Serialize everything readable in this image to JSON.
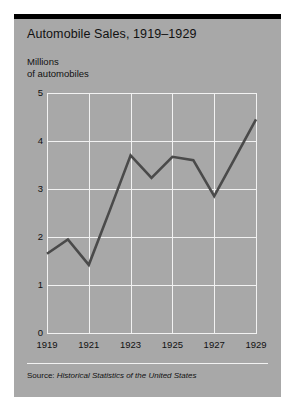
{
  "figure": {
    "title": "Automobile Sales, 1919–1929",
    "caption_line1": "Millions",
    "caption_line2": "of automobiles",
    "source_label": "Source:",
    "source_title": "Historical Statistics of the United States",
    "background_color": "#a8a8a8",
    "rule_color": "#000000",
    "grid_color": "#f2f2f2",
    "line_color": "#4a4a4a",
    "text_color": "#111111"
  },
  "chart_data": {
    "type": "line",
    "title": "Automobile Sales, 1919–1929",
    "subtitle": "",
    "xlabel": "",
    "ylabel": "Millions of automobiles",
    "x": [
      1919,
      1920,
      1921,
      1922,
      1923,
      1924,
      1925,
      1926,
      1927,
      1928,
      1929
    ],
    "values": [
      1.65,
      1.95,
      1.42,
      2.55,
      3.7,
      3.23,
      3.67,
      3.6,
      2.85,
      3.65,
      4.45
    ],
    "series": [
      {
        "name": "Automobile sales",
        "values": [
          1.65,
          1.95,
          1.42,
          2.55,
          3.7,
          3.23,
          3.67,
          3.6,
          2.85,
          3.65,
          4.45
        ]
      }
    ],
    "xlim": [
      1919,
      1929
    ],
    "ylim": [
      0,
      5
    ],
    "yticks": [
      0,
      1,
      2,
      3,
      4,
      5
    ],
    "ytick_labels": [
      "0",
      "1",
      "2",
      "3",
      "4",
      "5"
    ],
    "xticks": [
      1919,
      1921,
      1923,
      1925,
      1927,
      1929
    ],
    "xtick_labels": [
      "1919",
      "1921",
      "1923",
      "1925",
      "1927",
      "1929"
    ],
    "grid": true,
    "legend": false,
    "legend_position": "none",
    "annotations": []
  }
}
